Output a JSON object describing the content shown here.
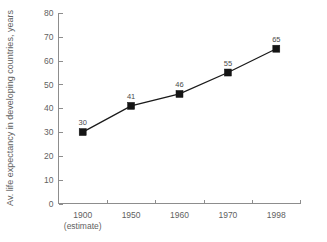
{
  "chart_data": {
    "type": "line",
    "title": "",
    "subtitle": "",
    "xlabel": "",
    "ylabel": "Av. life expectancy in developing countries, years",
    "categories": [
      "1900",
      "1950",
      "1960",
      "1970",
      "1998"
    ],
    "category_sublabels": [
      "(estimate)",
      "",
      "",
      "",
      ""
    ],
    "values": [
      30,
      41,
      46,
      55,
      65
    ],
    "point_labels": [
      "30",
      "41",
      "46",
      "55",
      "65"
    ],
    "ylim": [
      0,
      80
    ],
    "ytick_step": 10,
    "ytick_labels": [
      "0",
      "10",
      "20",
      "30",
      "40",
      "50",
      "60",
      "70",
      "80"
    ],
    "grid": false,
    "legend": "none",
    "marker": "square",
    "colors": {
      "line": "#141414",
      "marker": "#141414",
      "axis": "#8d8d8d",
      "text": "#5f5f5f",
      "background": "#ffffff"
    }
  }
}
